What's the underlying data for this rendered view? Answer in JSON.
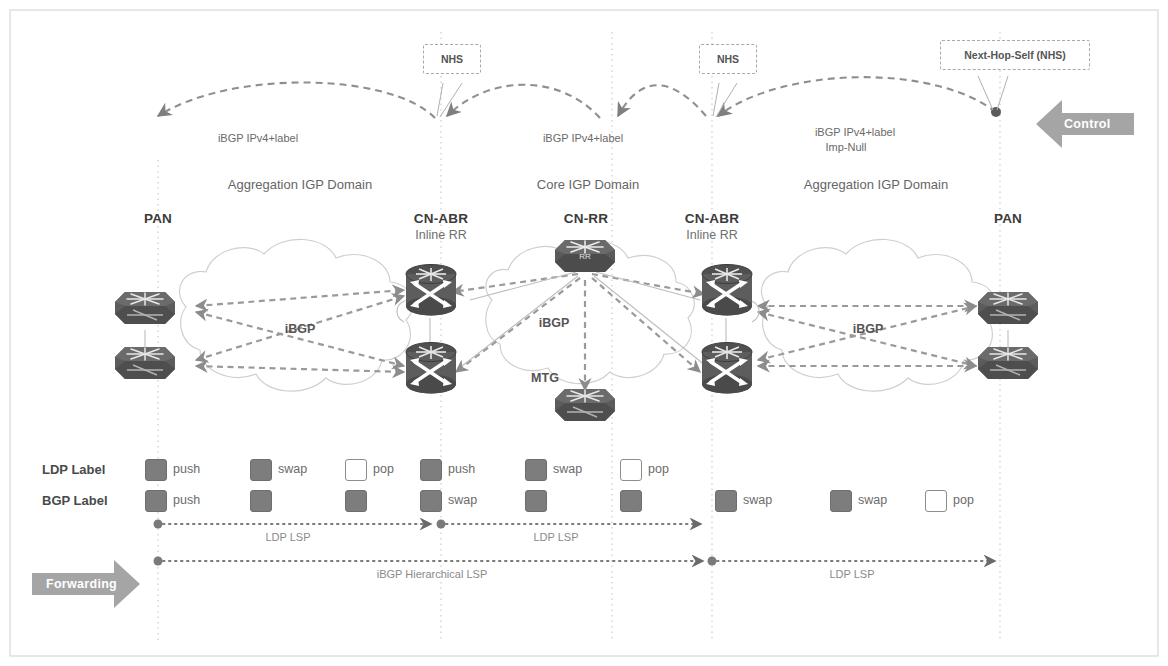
{
  "diagram": {
    "background": "#ffffff",
    "colors": {
      "node_fill": "#5a5a5a",
      "chip_filled": "#7d7d7d",
      "chip_hollow": "#ffffff",
      "cloud_stroke": "#c9c9c9",
      "dash_link": "#8d8d8d",
      "divider": "#c0c0c0",
      "banner": "#9a9a9a",
      "text": "#5a5a5a"
    }
  },
  "banners": {
    "control": {
      "label": "Control",
      "direction": "left"
    },
    "forwarding": {
      "label": "Forwarding",
      "direction": "right"
    }
  },
  "callouts": [
    {
      "id": "nhs-left",
      "label": "NHS"
    },
    {
      "id": "nhs-mid",
      "label": "NHS"
    },
    {
      "id": "nhs-right",
      "label": "Next-Hop-Self (NHS)"
    }
  ],
  "control_plane": {
    "sessions": [
      {
        "id": "session-left",
        "label": "iBGP IPv4+label",
        "sublabel": ""
      },
      {
        "id": "session-mid",
        "label": "iBGP IPv4+label",
        "sublabel": ""
      },
      {
        "id": "session-right",
        "label": "iBGP IPv4+label",
        "sublabel": "Imp-Null"
      }
    ]
  },
  "domains": [
    {
      "id": "domain-agg-left",
      "label": "Aggregation IGP Domain"
    },
    {
      "id": "domain-core",
      "label": "Core IGP Domain"
    },
    {
      "id": "domain-agg-right",
      "label": "Aggregation IGP Domain"
    }
  ],
  "nodes": [
    {
      "id": "pan-left",
      "title": "PAN",
      "subtitle": ""
    },
    {
      "id": "cn-abr-left",
      "title": "CN-ABR",
      "subtitle": "Inline RR"
    },
    {
      "id": "cn-rr",
      "title": "CN-RR",
      "subtitle": ""
    },
    {
      "id": "cn-abr-right",
      "title": "CN-ABR",
      "subtitle": "Inline RR"
    },
    {
      "id": "pan-right",
      "title": "PAN",
      "subtitle": ""
    }
  ],
  "inner_links": [
    {
      "id": "ibgp-agg-left",
      "label": "iBGP"
    },
    {
      "id": "ibgp-core",
      "label": "iBGP"
    },
    {
      "id": "mtg-core",
      "label": "MTG"
    },
    {
      "id": "ibgp-agg-right",
      "label": "iBGP"
    }
  ],
  "label_stack": {
    "rows": [
      {
        "id": "ldp-label-row",
        "title": "LDP Label",
        "cells": [
          {
            "x": 145,
            "style": "filled",
            "op": "push"
          },
          {
            "x": 250,
            "style": "filled",
            "op": "swap"
          },
          {
            "x": 345,
            "style": "hollow",
            "op": "pop"
          },
          {
            "x": 420,
            "style": "filled",
            "op": "push"
          },
          {
            "x": 525,
            "style": "filled",
            "op": "swap"
          },
          {
            "x": 620,
            "style": "hollow",
            "op": "pop"
          }
        ]
      },
      {
        "id": "bgp-label-row",
        "title": "BGP Label",
        "cells": [
          {
            "x": 145,
            "style": "filled",
            "op": "push"
          },
          {
            "x": 250,
            "style": "filled",
            "op": ""
          },
          {
            "x": 345,
            "style": "filled",
            "op": ""
          },
          {
            "x": 420,
            "style": "filled",
            "op": "swap"
          },
          {
            "x": 525,
            "style": "filled",
            "op": ""
          },
          {
            "x": 620,
            "style": "filled",
            "op": ""
          },
          {
            "x": 715,
            "style": "filled",
            "op": "swap"
          },
          {
            "x": 830,
            "style": "filled",
            "op": "swap"
          },
          {
            "x": 925,
            "style": "hollow",
            "op": "pop"
          }
        ]
      }
    ]
  },
  "lsp_rows": [
    {
      "id": "lsp-row-top",
      "segments": [
        {
          "id": "ldp-lsp-1",
          "label": "LDP LSP"
        },
        {
          "id": "ldp-lsp-2",
          "label": "LDP LSP"
        }
      ]
    },
    {
      "id": "lsp-row-bottom",
      "segments": [
        {
          "id": "ibgp-hier-lsp",
          "label": "iBGP  Hierarchical LSP"
        },
        {
          "id": "ldp-lsp-3",
          "label": "LDP LSP"
        }
      ]
    }
  ]
}
